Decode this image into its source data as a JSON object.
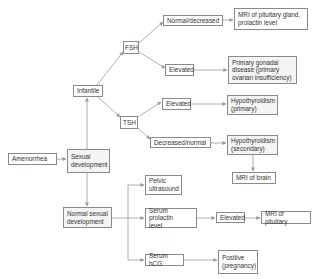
{
  "diagram": {
    "type": "flowchart",
    "nodes": {
      "amenorrhea": "Amenorrhea",
      "sexual_development": "Sexual\ndevelopment",
      "infantile": "Infantile",
      "fsh": "FSH",
      "tsh": "TSH",
      "fsh_normal_decreased": "Normal/decreased",
      "mri_pituitary_gland": "MRI of pituitary gland,\nprolactin level",
      "fsh_elevated": "Elevated",
      "primary_gonadal_disease": "Primary gonadal\ndisease (primary\novarian insufficiency)",
      "tsh_elevated": "Elevated",
      "hypothyroidism_primary": "Hypothyroidism\n(primary)",
      "tsh_decreased_normal": "Decreased/normal",
      "hypothyroidism_secondary": "Hypothyroidism\n(secondary)",
      "mri_brain": "MRI of brain",
      "normal_sexual_development": "Normal sexual\ndevelopment",
      "pelvic_ultrasound": "Pelvic\nultrasound",
      "serum_prolactin": "Serum prolactin\nlevel",
      "prolactin_elevated": "Elevated",
      "mri_pituitary": "MRI of pituitary",
      "serum_hcg": "Serum hCG",
      "positive_pregnancy": "Positive\n(pregnancy)"
    },
    "edges": [
      [
        "amenorrhea",
        "sexual_development"
      ],
      [
        "sexual_development",
        "infantile"
      ],
      [
        "sexual_development",
        "normal_sexual_development"
      ],
      [
        "infantile",
        "fsh"
      ],
      [
        "infantile",
        "tsh"
      ],
      [
        "fsh",
        "fsh_normal_decreased"
      ],
      [
        "fsh",
        "fsh_elevated"
      ],
      [
        "fsh_normal_decreased",
        "mri_pituitary_gland"
      ],
      [
        "fsh_elevated",
        "primary_gonadal_disease"
      ],
      [
        "tsh",
        "tsh_elevated"
      ],
      [
        "tsh",
        "tsh_decreased_normal"
      ],
      [
        "tsh_elevated",
        "hypothyroidism_primary"
      ],
      [
        "tsh_decreased_normal",
        "hypothyroidism_secondary"
      ],
      [
        "hypothyroidism_secondary",
        "mri_brain"
      ],
      [
        "normal_sexual_development",
        "pelvic_ultrasound"
      ],
      [
        "normal_sexual_development",
        "serum_prolactin"
      ],
      [
        "normal_sexual_development",
        "serum_hcg"
      ],
      [
        "serum_prolactin",
        "prolactin_elevated"
      ],
      [
        "prolactin_elevated",
        "mri_pituitary"
      ],
      [
        "serum_hcg",
        "positive_pregnancy"
      ]
    ],
    "colors": {
      "line": "#9a9a9a",
      "border": "#8a8a8a",
      "text": "#333333"
    }
  }
}
